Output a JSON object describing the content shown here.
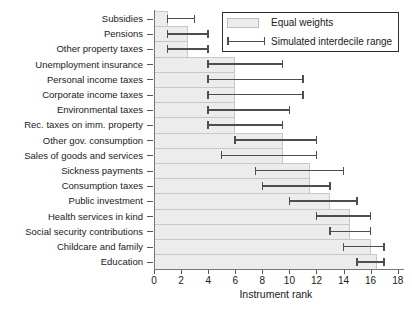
{
  "chart_data": {
    "type": "bar",
    "orientation": "horizontal",
    "title": "",
    "xlabel": "Instrument rank",
    "ylabel": "",
    "xlim": [
      0,
      18
    ],
    "xticks": [
      0,
      2,
      4,
      6,
      8,
      10,
      12,
      14,
      16,
      18
    ],
    "grid": false,
    "legend_position": "top-right",
    "categories": [
      "Subsidies",
      "Pensions",
      "Other property taxes",
      "Unemployment insurance",
      "Personal income taxes",
      "Corporate income taxes",
      "Environmental taxes",
      "Rec. taxes on imm. property",
      "Other gov. consumption",
      "Sales of goods and services",
      "Sickness payments",
      "Consumption taxes",
      "Public investment",
      "Health services in kind",
      "Social security contributions",
      "Childcare and family",
      "Education"
    ],
    "series": [
      {
        "name": "Equal weights",
        "type": "bar",
        "values": [
          1,
          2.5,
          2.5,
          6,
          6,
          6,
          6,
          6,
          9.5,
          9.5,
          11.5,
          11.5,
          13,
          14.5,
          14.5,
          16,
          16.5
        ]
      },
      {
        "name": "Simulated interdecile range",
        "type": "errorbar",
        "low": [
          1,
          1,
          1,
          4,
          4,
          4,
          4,
          4,
          6,
          5,
          7.5,
          8,
          10,
          12,
          13,
          14,
          15
        ],
        "high": [
          3,
          4,
          4,
          9.5,
          11,
          11,
          10,
          9.5,
          12,
          12,
          14,
          13,
          15,
          16,
          16,
          17,
          17
        ]
      }
    ],
    "colors": {
      "background": "#ffffff",
      "bar_fill": "#ececec",
      "bar_border": "#c8c8c8",
      "whisker": "#4d4d4d",
      "axis": "#777777",
      "tick": "#555555",
      "text": "#1a1a1a",
      "legend_border": "#2e2e2e"
    }
  }
}
